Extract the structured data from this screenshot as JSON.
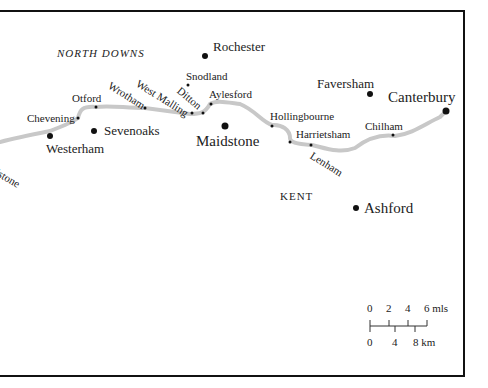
{
  "map": {
    "region_labels": {
      "north_downs": "NORTH DOWNS",
      "kent": "KENT"
    },
    "towns": {
      "rochester": "Rochester",
      "snodland": "Snodland",
      "faversham": "Faversham",
      "canterbury": "Canterbury",
      "otford": "Otford",
      "chevening": "Chevening",
      "westerham": "Westerham",
      "sevenoaks": "Sevenoaks",
      "wrotham": "Wrotham",
      "west_malling": "West Malling",
      "ditton": "Ditton",
      "aylesford": "Aylesford",
      "maidstone": "Maidstone",
      "hollingbourne": "Hollingbourne",
      "harrietsham": "Harrietsham",
      "lenham": "Lenham",
      "chilham": "Chilham",
      "ashford": "Ashford",
      "godstone_partial": "odstone"
    },
    "scale": {
      "miles_ticks": [
        "0",
        "2",
        "4",
        "6 mls"
      ],
      "km_ticks": [
        "0",
        "4",
        "8 km"
      ]
    },
    "colors": {
      "route": "#c8c8c8",
      "frame": "#111111",
      "dot": "#111111"
    }
  }
}
